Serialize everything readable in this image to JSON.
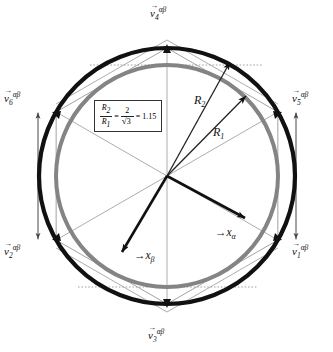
{
  "figure": {
    "name": "space-vector-hexagon-diagram",
    "center": {
      "x": 167,
      "y": 176
    },
    "colors": {
      "outer_circle": "#111111",
      "inner_circle": "#848484",
      "thin_lines": "#777777",
      "dotted_lines": "#999999",
      "vector_arrows": "#111111",
      "text": "#111111"
    }
  },
  "vectors": [
    {
      "id": "v1",
      "base": "v",
      "sub": "1",
      "sup": "αβ",
      "angle_deg": -30,
      "label_x": 292,
      "label_y": 244
    },
    {
      "id": "v2",
      "base": "v",
      "sub": "2",
      "sup": "αβ",
      "angle_deg": 210,
      "label_x": 4,
      "label_y": 244
    },
    {
      "id": "v3",
      "base": "v",
      "sub": "3",
      "sup": "αβ",
      "angle_deg": 270,
      "label_x": 148,
      "label_y": 328
    },
    {
      "id": "v4",
      "base": "v",
      "sub": "4",
      "sup": "αβ",
      "angle_deg": 90,
      "label_x": 150,
      "label_y": 6
    },
    {
      "id": "v5",
      "base": "v",
      "sub": "5",
      "sup": "αβ",
      "angle_deg": 30,
      "label_x": 292,
      "label_y": 91
    },
    {
      "id": "v6",
      "base": "v",
      "sub": "6",
      "sup": "αβ",
      "angle_deg": 150,
      "label_x": 4,
      "label_y": 91
    }
  ],
  "radii": [
    {
      "id": "r2",
      "base": "R",
      "sub": "2",
      "label_x": 194,
      "label_y": 94,
      "note": "outer radius to hexagon vertex circle"
    },
    {
      "id": "r1",
      "base": "R",
      "sub": "1",
      "label_x": 213,
      "label_y": 126,
      "note": "inner radius to inscribed circle"
    }
  ],
  "axes": [
    {
      "id": "x_alpha",
      "base": "x",
      "sub": "α",
      "label_x": 215,
      "label_y": 227
    },
    {
      "id": "x_beta",
      "base": "x",
      "sub": "β",
      "label_x": 134,
      "label_y": 250
    }
  ],
  "formula": {
    "numerator_top": "R",
    "numerator_top_sub": "2",
    "numerator_bottom": "R",
    "numerator_bottom_sub": "1",
    "equals": "=",
    "frac_num": "2",
    "frac_den_radical": "3",
    "result_equals": "=",
    "result": "1.15"
  },
  "geometry": {
    "outer_radius_px": 128,
    "inner_radius_px": 111,
    "hexagon_circumradius_px": 128,
    "hexagon_vertex_angles_deg": [
      -30,
      30,
      90,
      150,
      210,
      270
    ]
  }
}
